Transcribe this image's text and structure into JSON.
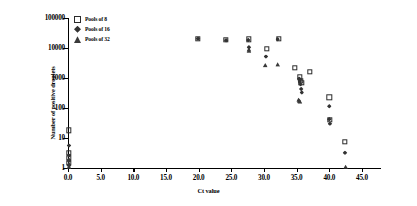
{
  "chart_data": {
    "type": "scatter",
    "title": "",
    "xlabel": "Ct value",
    "ylabel": "Number of positive droplets",
    "xlim": [
      0,
      47
    ],
    "ylim": [
      1,
      100000
    ],
    "yscale": "log",
    "grid": false,
    "legend_position": "top-left",
    "xticks": [
      "0.0",
      "5.0",
      "10.0",
      "15.0",
      "20.0",
      "25.0",
      "30.0",
      "35.0",
      "40.0",
      "45.0"
    ],
    "xtick_values": [
      0,
      5,
      10,
      15,
      20,
      25,
      30,
      35,
      40,
      45
    ],
    "yticks": [
      "1",
      "10",
      "100",
      "1000",
      "10000",
      "100000"
    ],
    "ytick_values": [
      1,
      10,
      100,
      1000,
      10000,
      100000
    ],
    "series": [
      {
        "name": "Pools of 8",
        "marker": "open-square",
        "color": "#2b2b2b",
        "points": [
          [
            0.15,
            18
          ],
          [
            0.15,
            3.2
          ],
          [
            0.15,
            2.2
          ],
          [
            0.15,
            1.5
          ],
          [
            19.9,
            20000
          ],
          [
            24.2,
            18500
          ],
          [
            27.7,
            19500
          ],
          [
            32.3,
            20000
          ],
          [
            30.4,
            9500
          ],
          [
            34.7,
            2200
          ],
          [
            37.0,
            1600
          ],
          [
            35.5,
            1050
          ],
          [
            35.6,
            800
          ],
          [
            35.7,
            700
          ],
          [
            40.0,
            230
          ],
          [
            40.1,
            40
          ],
          [
            42.4,
            7.5
          ]
        ]
      },
      {
        "name": "Pools of 16",
        "marker": "filled-diamond",
        "color": "#333333",
        "points": [
          [
            0.15,
            5.6
          ],
          [
            0.15,
            2.6
          ],
          [
            0.15,
            1.8
          ],
          [
            0.15,
            1.2
          ],
          [
            19.9,
            20500
          ],
          [
            24.2,
            18000
          ],
          [
            27.6,
            18500
          ],
          [
            27.7,
            10500
          ],
          [
            32.1,
            19500
          ],
          [
            30.3,
            5200
          ],
          [
            35.4,
            950
          ],
          [
            35.5,
            780
          ],
          [
            35.6,
            620
          ],
          [
            35.7,
            430
          ],
          [
            35.8,
            330
          ],
          [
            40.0,
            115
          ],
          [
            40.0,
            42
          ],
          [
            40.1,
            30
          ],
          [
            42.4,
            3.2
          ]
        ]
      },
      {
        "name": "Pools of 32",
        "marker": "filled-triangle",
        "color": "#3a3a3a",
        "points": [
          [
            0.15,
            1.9
          ],
          [
            0.15,
            1.4
          ],
          [
            0.15,
            1.1
          ],
          [
            27.7,
            9000
          ],
          [
            27.7,
            8200
          ],
          [
            30.2,
            2700
          ],
          [
            32.1,
            2850
          ],
          [
            35.3,
            190
          ],
          [
            35.4,
            175
          ],
          [
            35.5,
            165
          ],
          [
            42.5,
            1.1
          ]
        ]
      }
    ]
  },
  "legend": {
    "items": [
      {
        "label": "Pools of 8",
        "marker": "open-square"
      },
      {
        "label": "Pools of 16",
        "marker": "filled-diamond"
      },
      {
        "label": "Pools of 32",
        "marker": "filled-triangle"
      }
    ]
  }
}
